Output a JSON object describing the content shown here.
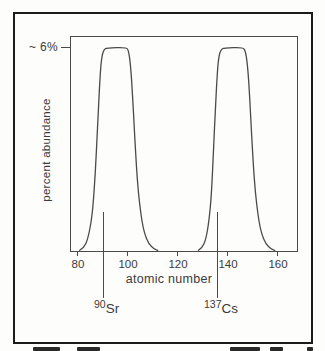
{
  "colors": {
    "frame": "#1b1b1b",
    "line": "#4a4a4a",
    "text": "#3b3b3b",
    "background": "#fdfdfb"
  },
  "figure": {
    "y_axis": {
      "label": "percent abundance",
      "tick_label": "~ 6%"
    },
    "x_axis": {
      "label": "atomic number",
      "tick_labels": [
        "80",
        "100",
        "120",
        "140",
        "160"
      ]
    },
    "isotope_labels": [
      {
        "mass_number": "90",
        "symbol": "Sr"
      },
      {
        "mass_number": "137",
        "symbol": "Cs"
      }
    ]
  },
  "chart_data": {
    "type": "line",
    "title": "",
    "xlabel": "atomic number",
    "ylabel": "percent abundance",
    "xlim": [
      77,
      167
    ],
    "ylim": [
      0,
      6.6
    ],
    "x_ticks": [
      80,
      100,
      120,
      140,
      160
    ],
    "y_tick_annotation": {
      "value": 6,
      "label": "~ 6%"
    },
    "grid": false,
    "legend": "none",
    "series": [
      {
        "name": "light fission fragment peak (Sr-90 region)",
        "points": [
          [
            80.3,
            0.02
          ],
          [
            82,
            0.1
          ],
          [
            83.5,
            0.35
          ],
          [
            85,
            0.9
          ],
          [
            86,
            1.7
          ],
          [
            87,
            3.0
          ],
          [
            87.8,
            4.3
          ],
          [
            88.5,
            5.3
          ],
          [
            89.2,
            5.82
          ],
          [
            90,
            5.98
          ],
          [
            91,
            6.03
          ],
          [
            99,
            6.05
          ],
          [
            99.8,
            5.95
          ],
          [
            100.5,
            5.6
          ],
          [
            101.3,
            4.8
          ],
          [
            102.2,
            3.5
          ],
          [
            103.2,
            2.2
          ],
          [
            104.5,
            1.2
          ],
          [
            106,
            0.55
          ],
          [
            108,
            0.2
          ],
          [
            110,
            0.06
          ],
          [
            111.5,
            0.02
          ]
        ]
      },
      {
        "name": "heavy fission fragment peak (Cs-137 region)",
        "points": [
          [
            127.8,
            0.02
          ],
          [
            129.3,
            0.1
          ],
          [
            130.8,
            0.35
          ],
          [
            132,
            0.9
          ],
          [
            133,
            1.7
          ],
          [
            133.8,
            3.0
          ],
          [
            134.6,
            4.3
          ],
          [
            135.3,
            5.3
          ],
          [
            136,
            5.82
          ],
          [
            136.8,
            5.98
          ],
          [
            138,
            6.03
          ],
          [
            145.5,
            6.05
          ],
          [
            146.5,
            5.95
          ],
          [
            147.3,
            5.6
          ],
          [
            148.1,
            4.8
          ],
          [
            149,
            3.5
          ],
          [
            150,
            2.2
          ],
          [
            151.3,
            1.2
          ],
          [
            152.8,
            0.55
          ],
          [
            154.8,
            0.2
          ],
          [
            156.8,
            0.06
          ],
          [
            158.3,
            0.02
          ]
        ]
      }
    ],
    "markers": [
      {
        "x": 90,
        "label": "90Sr"
      },
      {
        "x": 137,
        "label": "137Cs"
      }
    ]
  }
}
